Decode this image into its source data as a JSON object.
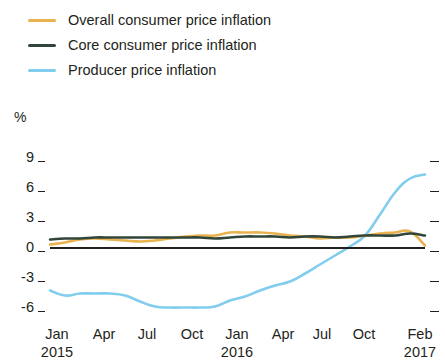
{
  "chart_data": {
    "type": "line",
    "title": "",
    "subtitle": "",
    "xlabel": "",
    "ylabel": "%",
    "ylim": [
      -7.5,
      10.5
    ],
    "yticks": [
      9,
      6,
      3,
      0,
      -3,
      -6
    ],
    "ytick_labels": [
      "9",
      "6",
      "3",
      "0",
      "-3",
      "-6"
    ],
    "grid": false,
    "zero_line": true,
    "legend_position": "top-left",
    "x": [
      "Jan 2015",
      "Feb 2015",
      "Mar 2015",
      "Apr 2015",
      "May 2015",
      "Jun 2015",
      "Jul 2015",
      "Aug 2015",
      "Sep 2015",
      "Oct 2015",
      "Nov 2015",
      "Dec 2015",
      "Jan 2016",
      "Feb 2016",
      "Mar 2016",
      "Apr 2016",
      "May 2016",
      "Jun 2016",
      "Jul 2016",
      "Aug 2016",
      "Sep 2016",
      "Oct 2016",
      "Nov 2016",
      "Dec 2016",
      "Jan 2017",
      "Feb 2017"
    ],
    "xtick_labels": [
      "Jan",
      "Apr",
      "Jul",
      "Oct",
      "Jan",
      "Apr",
      "Jul",
      "Oct",
      "Feb"
    ],
    "xtick_years": [
      "2015",
      "",
      "",
      "",
      "2016",
      "",
      "",
      "",
      "2017"
    ],
    "series": [
      {
        "name": "Overall consumer price inflation",
        "color": "#e8b24f",
        "values": [
          0.3,
          0.5,
          0.8,
          0.9,
          0.8,
          0.7,
          0.6,
          0.7,
          0.9,
          1.1,
          1.2,
          1.2,
          1.5,
          1.5,
          1.5,
          1.4,
          1.2,
          1.1,
          0.9,
          1.0,
          1.0,
          1.2,
          1.4,
          1.5,
          1.6,
          0.2
        ]
      },
      {
        "name": "Core consumer price inflation",
        "color": "#31453a",
        "values": [
          0.8,
          0.9,
          0.9,
          1.0,
          1.0,
          1.0,
          1.0,
          1.0,
          1.0,
          1.0,
          1.0,
          0.9,
          1.0,
          1.1,
          1.1,
          1.1,
          1.0,
          1.1,
          1.1,
          1.0,
          1.1,
          1.2,
          1.2,
          1.2,
          1.4,
          1.2
        ]
      },
      {
        "name": "Producer price inflation",
        "color": "#80cdee",
        "values": [
          -4.3,
          -4.8,
          -4.6,
          -4.6,
          -4.6,
          -4.8,
          -5.4,
          -5.9,
          -6.0,
          -6.0,
          -6.0,
          -5.9,
          -5.3,
          -4.9,
          -4.3,
          -3.8,
          -3.4,
          -2.6,
          -1.7,
          -0.8,
          0.1,
          1.2,
          3.3,
          5.5,
          6.9,
          7.3
        ]
      }
    ]
  },
  "legend": {
    "items": [
      {
        "label": "Overall consumer price inflation",
        "color": "#e8b24f"
      },
      {
        "label": "Core consumer price inflation",
        "color": "#31453a"
      },
      {
        "label": "Producer price inflation",
        "color": "#80cdee"
      }
    ]
  },
  "axes": {
    "unit": "%"
  }
}
